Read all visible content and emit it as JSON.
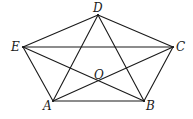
{
  "figure": {
    "type": "geometry-diagram",
    "stroke_color": "#1a1a1a",
    "background": "#ffffff"
  },
  "points": [
    {
      "id": "A",
      "label": "A",
      "x": 53,
      "y": 101,
      "label_x": 43,
      "label_y": 110
    },
    {
      "id": "B",
      "label": "B",
      "x": 144,
      "y": 101,
      "label_x": 146,
      "label_y": 110
    },
    {
      "id": "C",
      "label": "C",
      "x": 173,
      "y": 47,
      "label_x": 176,
      "label_y": 51
    },
    {
      "id": "D",
      "label": "D",
      "x": 98,
      "y": 15,
      "label_x": 93,
      "label_y": 12
    },
    {
      "id": "E",
      "label": "E",
      "x": 23,
      "y": 47,
      "label_x": 11,
      "label_y": 51
    },
    {
      "id": "O",
      "label": "O",
      "x": 98,
      "y": 81,
      "label_x": 94,
      "label_y": 79
    }
  ],
  "segments": [
    {
      "from": "A",
      "to": "B",
      "kind": "side"
    },
    {
      "from": "B",
      "to": "C",
      "kind": "side"
    },
    {
      "from": "C",
      "to": "D",
      "kind": "side"
    },
    {
      "from": "D",
      "to": "E",
      "kind": "side"
    },
    {
      "from": "E",
      "to": "A",
      "kind": "side"
    },
    {
      "from": "A",
      "to": "C",
      "kind": "diagonal"
    },
    {
      "from": "A",
      "to": "D",
      "kind": "diagonal"
    },
    {
      "from": "B",
      "to": "D",
      "kind": "diagonal"
    },
    {
      "from": "B",
      "to": "E",
      "kind": "diagonal"
    },
    {
      "from": "C",
      "to": "E",
      "kind": "diagonal"
    }
  ]
}
